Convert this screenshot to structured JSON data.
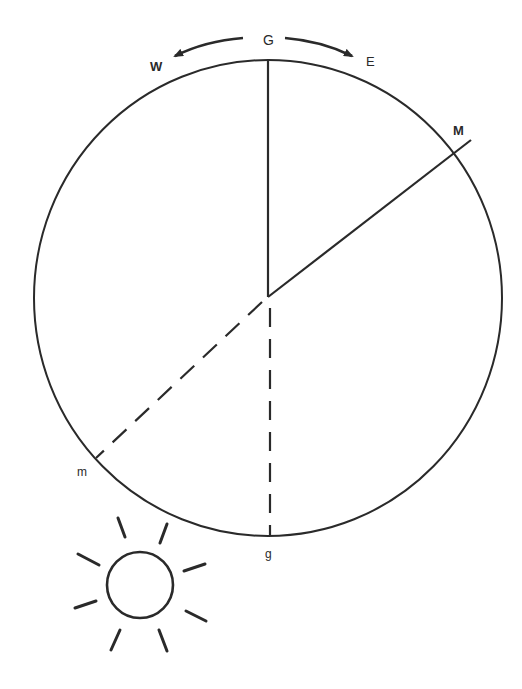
{
  "diagram": {
    "labels": {
      "top": "G",
      "west": "W",
      "east": "E",
      "moon": "M",
      "moon_opposite": "m",
      "bottom": "g"
    },
    "elements": {
      "circle": "orbit-circle",
      "solid_lines": [
        "center-to-G",
        "center-to-M"
      ],
      "dashed_lines": [
        "center-to-g",
        "center-to-m"
      ],
      "arrows": [
        "arrow-west",
        "arrow-east"
      ],
      "sun": "sun-icon"
    },
    "colors": {
      "stroke": "#2a2a2a",
      "background": "#ffffff"
    }
  }
}
